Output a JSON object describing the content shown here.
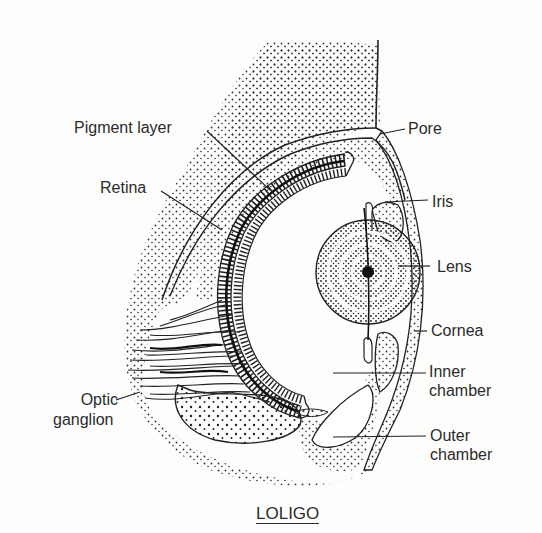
{
  "diagram": {
    "title": "LOLIGO",
    "labels": {
      "pigment_layer": "Pigment layer",
      "retina": "Retina",
      "pore": "Pore",
      "iris": "Iris",
      "lens": "Lens",
      "cornea": "Cornea",
      "inner_chamber_1": "Inner",
      "inner_chamber_2": "chamber",
      "outer_chamber_1": "Outer",
      "outer_chamber_2": "chamber",
      "optic_ganglion_1": "Optic",
      "optic_ganglion_2": "ganglion"
    },
    "colors": {
      "ink": "#2b2b2b",
      "paper": "#fdfdfc"
    }
  }
}
